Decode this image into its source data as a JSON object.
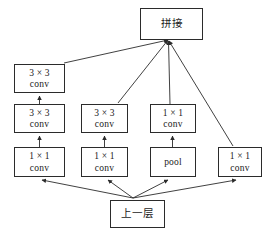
{
  "figure": {
    "kind": "neural-network-module-diagram",
    "width": 272,
    "height": 233,
    "background_color": "#ffffff",
    "stroke_color": "#2b2b2b",
    "text_color": "#1a1a1a"
  },
  "nodes": {
    "concat": {
      "label": "拼接"
    },
    "prev_layer": {
      "label": "上一层"
    },
    "branch1": {
      "top": {
        "line1": "3 × 3",
        "line2": "conv"
      },
      "mid": {
        "line1": "3 × 3",
        "line2": "conv"
      },
      "bottom": {
        "line1": "1 × 1",
        "line2": "conv"
      }
    },
    "branch2": {
      "top": {
        "line1": "3 × 3",
        "line2": "conv"
      },
      "bottom": {
        "line1": "1 × 1",
        "line2": "conv"
      }
    },
    "branch3": {
      "top": {
        "line1": "1 × 1",
        "line2": "conv"
      },
      "bottom": {
        "line1": "pool"
      }
    },
    "branch4": {
      "only": {
        "line1": "1 × 1",
        "line2": "conv"
      }
    }
  },
  "edges": {
    "concat_junction": {
      "x": 168,
      "y": 40
    },
    "input_junction": {
      "x": 133,
      "y": 198
    },
    "arrow_head_size": 4
  }
}
